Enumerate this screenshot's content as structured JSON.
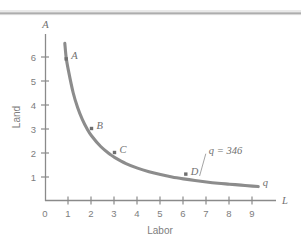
{
  "figure": {
    "background_color": "#ffffff",
    "top_rule_color": "#a8a8a8",
    "axis_color": "#8a8a8a",
    "curve_color": "#8c8c8c",
    "text_color": "#7d7d7d",
    "label_color": "#6f6f6f"
  },
  "chart_data": {
    "type": "line",
    "title": "",
    "subtitle": "",
    "xlabel": "Labor",
    "ylabel": "Land",
    "x_axis_variable": "L",
    "y_axis_variable": "A",
    "xlim": [
      0,
      9.6
    ],
    "ylim": [
      0,
      6.8
    ],
    "xticks": [
      0,
      1,
      2,
      3,
      4,
      5,
      6,
      7,
      8,
      9
    ],
    "xtick_labels": [
      "0",
      "1",
      "2",
      "3",
      "4",
      "5",
      "6",
      "7",
      "8",
      "9"
    ],
    "yticks": [
      1,
      2,
      3,
      4,
      5,
      6
    ],
    "ytick_labels": [
      "1",
      "2",
      "3",
      "4",
      "5",
      "6"
    ],
    "grid": false,
    "legend": "none",
    "series": [
      {
        "name": "isoquant",
        "label": "q",
        "annotation": "q = 346",
        "curve_equation": "L * A = 5.4",
        "x": [
          0.84,
          0.9,
          1.0,
          1.2,
          1.4,
          1.6,
          1.8,
          2.0,
          2.4,
          2.8,
          3.0,
          3.5,
          4.0,
          4.5,
          5.0,
          5.5,
          6.0,
          6.5,
          7.0,
          7.5,
          8.0,
          8.5,
          9.0,
          9.25
        ],
        "y": [
          6.55,
          5.95,
          5.4,
          4.5,
          3.86,
          3.38,
          3.0,
          2.7,
          2.25,
          1.93,
          1.8,
          1.54,
          1.35,
          1.2,
          1.08,
          0.98,
          0.9,
          0.83,
          0.77,
          0.72,
          0.68,
          0.64,
          0.6,
          0.58
        ]
      }
    ],
    "points": [
      {
        "label": "A",
        "x": 0.9,
        "y": 5.9
      },
      {
        "label": "B",
        "x": 2.0,
        "y": 3.0
      },
      {
        "label": "C",
        "x": 3.0,
        "y": 2.0
      },
      {
        "label": "D",
        "x": 6.1,
        "y": 1.1
      }
    ],
    "annotations": [
      {
        "text": "q = 346",
        "x": 7.1,
        "y": 1.95,
        "leader_to_x": 6.7,
        "leader_to_y": 1.02
      },
      {
        "text": "q",
        "x": 9.45,
        "y": 0.62
      }
    ]
  }
}
